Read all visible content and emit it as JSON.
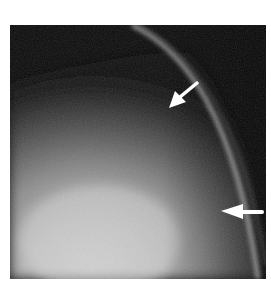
{
  "figure": {
    "type": "grayscale-medical-image",
    "background_color": "#ffffff",
    "dark_region_color": "#0a0a0a",
    "bright_region_color": "#c8c8c8",
    "band_color": "#8a8a8a",
    "annotations": [
      {
        "name": "arrow-upper",
        "direction": "down-left",
        "color": "#ffffff"
      },
      {
        "name": "arrow-lower",
        "direction": "left",
        "color": "#ffffff"
      }
    ]
  }
}
